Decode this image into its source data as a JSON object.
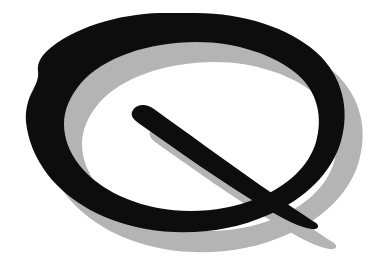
{
  "canvas": {
    "width": 383,
    "height": 275,
    "background_color": "#FFFFFF"
  },
  "logo": {
    "name": "Q Logo",
    "letter": "Q",
    "style": "hand-drawn brush stroke",
    "ink_color": "#0D0D0D",
    "shadow_color": "#B4B4B4",
    "shadow_offset_x": 18,
    "shadow_offset_y": 20,
    "stroke_min_width": 22,
    "stroke_max_width": 38,
    "elements": [
      {
        "id": "bowl",
        "label": "Q bowl",
        "description": "irregular hand-drawn closed ellipse ring, tilted slightly, thicker at left and bottom-right"
      },
      {
        "id": "tail",
        "label": "Q tail",
        "description": "tapered diagonal stroke from inside upper-left of bowl down across the lower-right of the ring, extending beyond the bowl"
      },
      {
        "id": "bowl-shadow",
        "label": "Q bowl drop shadow",
        "description": "gray copy of the bowl offset down and to the right"
      },
      {
        "id": "tail-shadow",
        "label": "Q tail drop shadow",
        "description": "gray copy of the tail offset down and to the right"
      }
    ],
    "bounds": {
      "ink_left": 25,
      "ink_top": 13,
      "ink_right": 345,
      "ink_bottom": 229,
      "shadow_right": 364,
      "shadow_bottom": 251
    }
  }
}
